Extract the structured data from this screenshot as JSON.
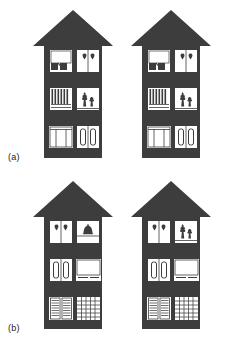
{
  "figure": {
    "background_color": "#ffffff",
    "house_color": "#3d3d3d",
    "window_color": "#ffffff",
    "detail_color": "#3d3d3d",
    "label_color": "#1a1a1a"
  },
  "panels": [
    {
      "id": "a",
      "label": "(a)",
      "houses": [
        {
          "id": "a-left",
          "name": "house-left",
          "windows": [
            {
              "floor": "top",
              "side": "left",
              "content": "roller-blind-with-objects"
            },
            {
              "floor": "top",
              "side": "right",
              "content": "two-hearts"
            },
            {
              "floor": "middle",
              "side": "left",
              "content": "vertical-slat-blinds"
            },
            {
              "floor": "middle",
              "side": "right",
              "content": "two-potted-plants"
            },
            {
              "floor": "bottom",
              "side": "left",
              "content": "wide-mullioned-window"
            },
            {
              "floor": "bottom",
              "side": "right",
              "content": "two-tall-panels"
            }
          ]
        },
        {
          "id": "a-right",
          "name": "house-right",
          "windows": [
            {
              "floor": "top",
              "side": "left",
              "content": "roller-blind-with-objects"
            },
            {
              "floor": "top",
              "side": "right",
              "content": "two-hearts"
            },
            {
              "floor": "middle",
              "side": "left",
              "content": "vertical-slat-blinds"
            },
            {
              "floor": "middle",
              "side": "right",
              "content": "two-potted-plants"
            },
            {
              "floor": "bottom",
              "side": "left",
              "content": "wide-mullioned-window"
            },
            {
              "floor": "bottom",
              "side": "right",
              "content": "two-tall-panels"
            }
          ]
        }
      ]
    },
    {
      "id": "b",
      "label": "(b)",
      "houses": [
        {
          "id": "b-left",
          "name": "house-left",
          "windows": [
            {
              "floor": "top",
              "side": "left",
              "content": "two-hearts"
            },
            {
              "floor": "top",
              "side": "right",
              "content": "bell-lampshade"
            },
            {
              "floor": "middle",
              "side": "left",
              "content": "two-tall-panels"
            },
            {
              "floor": "middle",
              "side": "right",
              "content": "plain-window-with-sill"
            },
            {
              "floor": "bottom",
              "side": "left",
              "content": "horizontal-louvred-shutters"
            },
            {
              "floor": "bottom",
              "side": "right",
              "content": "lattice-grid-window"
            }
          ]
        },
        {
          "id": "b-right",
          "name": "house-right",
          "windows": [
            {
              "floor": "top",
              "side": "left",
              "content": "two-hearts"
            },
            {
              "floor": "top",
              "side": "right",
              "content": "two-potted-plants"
            },
            {
              "floor": "middle",
              "side": "left",
              "content": "two-tall-panels"
            },
            {
              "floor": "middle",
              "side": "right",
              "content": "plain-window-with-sill"
            },
            {
              "floor": "bottom",
              "side": "left",
              "content": "horizontal-louvred-shutters"
            },
            {
              "floor": "bottom",
              "side": "right",
              "content": "lattice-grid-window"
            }
          ]
        }
      ]
    }
  ]
}
